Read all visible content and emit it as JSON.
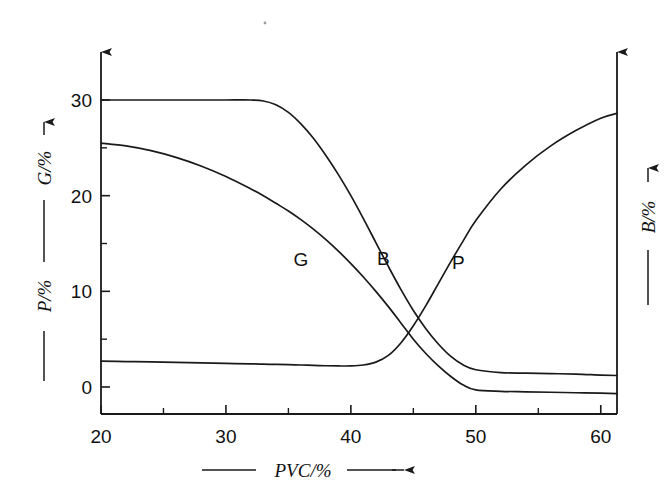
{
  "figure": {
    "background_color": "#ffffff",
    "ink_color": "#1a1a1a"
  },
  "axes": {
    "x": {
      "title": "PVC/%",
      "lead_rule": "——",
      "arrow": "→",
      "tick_labels": [
        "20",
        "30",
        "40",
        "50",
        "60"
      ],
      "tick_values": [
        20,
        30,
        40,
        50,
        60
      ],
      "minor_tick_values": [
        25,
        35,
        45,
        55
      ],
      "range": [
        20,
        61.3
      ]
    },
    "y_left": {
      "title_lower": "P/%",
      "title_upper": "G/%",
      "arrow": "↑",
      "tick_labels": [
        "0",
        "10",
        "20",
        "30"
      ],
      "tick_values": [
        0,
        10,
        20,
        30
      ],
      "minor_tick_values": [
        5,
        15,
        25
      ],
      "range": [
        -2.0,
        35.5
      ]
    },
    "y_right": {
      "title": "B/%",
      "arrow": "↑",
      "tick_labels": [],
      "range": [
        -2.0,
        35.5
      ]
    }
  },
  "curve_labels": [
    {
      "text": "G",
      "x": 36.0,
      "y": 12.6
    },
    {
      "text": "B",
      "x": 42.6,
      "y": 12.8
    },
    {
      "text": "P",
      "x": 48.6,
      "y": 12.3
    }
  ],
  "chart_data": {
    "type": "line",
    "title": "",
    "xlabel": "PVC/%",
    "ylabel": "P/%   G/%",
    "y2label": "B/%",
    "xlim": [
      20,
      61.3
    ],
    "ylim": [
      -2.0,
      35.5
    ],
    "grid": false,
    "legend": "inline-curve-labels",
    "x": [
      20,
      22,
      24,
      26,
      28,
      30,
      32,
      33,
      34,
      35,
      36,
      37,
      38,
      39,
      40,
      41,
      42,
      43,
      44,
      45,
      46,
      47,
      48,
      49,
      50,
      52,
      54,
      56,
      58,
      60,
      61.3
    ],
    "series": [
      {
        "name": "B",
        "label": "B",
        "axis": "right",
        "values": [
          30.0,
          30.0,
          30.0,
          30.0,
          30.0,
          30.0,
          30.0,
          29.9,
          29.5,
          28.7,
          27.5,
          26.0,
          24.2,
          22.2,
          20.0,
          17.6,
          15.1,
          12.6,
          10.2,
          8.0,
          6.1,
          4.5,
          3.2,
          2.3,
          1.8,
          1.5,
          1.45,
          1.4,
          1.35,
          1.25,
          1.2
        ]
      },
      {
        "name": "G",
        "label": "G",
        "axis": "left",
        "values": [
          25.5,
          25.2,
          24.7,
          24.0,
          23.1,
          22.0,
          20.7,
          20.0,
          19.2,
          18.4,
          17.5,
          16.5,
          15.4,
          14.2,
          12.9,
          11.5,
          10.0,
          8.4,
          6.7,
          5.0,
          3.5,
          2.2,
          1.1,
          0.2,
          -0.3,
          -0.45,
          -0.5,
          -0.55,
          -0.6,
          -0.65,
          -0.7
        ]
      },
      {
        "name": "P",
        "label": "P",
        "axis": "left",
        "values": [
          2.7,
          2.66,
          2.62,
          2.57,
          2.52,
          2.47,
          2.42,
          2.39,
          2.36,
          2.33,
          2.3,
          2.26,
          2.22,
          2.2,
          2.2,
          2.3,
          2.6,
          3.3,
          4.6,
          6.4,
          8.5,
          10.8,
          13.1,
          15.3,
          17.4,
          20.7,
          23.2,
          25.2,
          26.8,
          28.1,
          28.6
        ]
      }
    ]
  }
}
